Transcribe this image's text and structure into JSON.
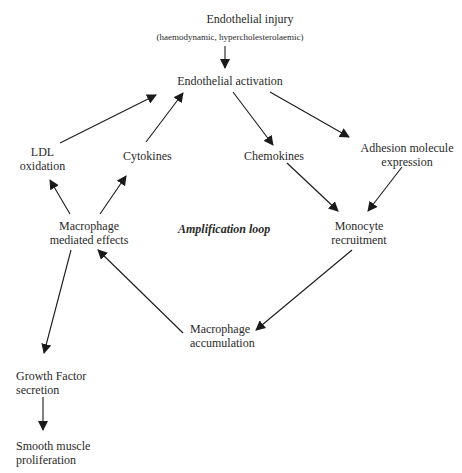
{
  "diagram": {
    "title": "Endothelial injury",
    "subtitle": "(haemodynamic, hypercholesterolaemic)",
    "nodes": {
      "endothelial_activation": "Endothelial activation",
      "ldl_oxidation_1": "LDL",
      "ldl_oxidation_2": "oxidation",
      "cytokines": "Cytokines",
      "chemokines": "Chemokines",
      "adhesion_1": "Adhesion molecule",
      "adhesion_2": "expression",
      "macrophage_effects_1": "Macrophage",
      "macrophage_effects_2": "mediated effects",
      "amplification_loop": "Amplification loop",
      "monocyte_1": "Monocyte",
      "monocyte_2": "recruitment",
      "macrophage_accum_1": "Macrophage",
      "macrophage_accum_2": "accumulation",
      "growth_factor_1": "Growth Factor",
      "growth_factor_2": "secretion",
      "smooth_muscle_1": "Smooth muscle",
      "smooth_muscle_2": "proliferation"
    },
    "edges": [
      {
        "from": "Endothelial injury",
        "to": "Endothelial activation"
      },
      {
        "from": "LDL oxidation",
        "to": "Endothelial activation"
      },
      {
        "from": "Cytokines",
        "to": "Endothelial activation"
      },
      {
        "from": "Endothelial activation",
        "to": "Chemokines"
      },
      {
        "from": "Endothelial activation",
        "to": "Adhesion molecule expression"
      },
      {
        "from": "Chemokines",
        "to": "Monocyte recruitment"
      },
      {
        "from": "Adhesion molecule expression",
        "to": "Monocyte recruitment"
      },
      {
        "from": "Monocyte recruitment",
        "to": "Macrophage accumulation"
      },
      {
        "from": "Macrophage accumulation",
        "to": "Macrophage mediated effects"
      },
      {
        "from": "Macrophage mediated effects",
        "to": "LDL oxidation"
      },
      {
        "from": "Macrophage mediated effects",
        "to": "Cytokines"
      },
      {
        "from": "Macrophage mediated effects",
        "to": "Growth Factor secretion"
      },
      {
        "from": "Growth Factor secretion",
        "to": "Smooth muscle proliferation"
      }
    ],
    "colors": {
      "line": "#1a1a1a",
      "text": "#2a2a2a"
    }
  }
}
